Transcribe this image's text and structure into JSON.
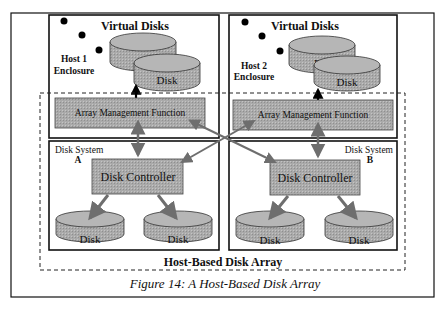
{
  "figure": {
    "caption": "Figure 14: A Host-Based Disk Array",
    "array_label": "Host-Based Disk Array"
  },
  "hosts": [
    {
      "title": "Virtual Disks",
      "enclosure_line1": "Host 1",
      "enclosure_line2": "Enclosure",
      "virtual_disk_label": "Disk",
      "amf_label": "Array Management Function"
    },
    {
      "title": "Virtual Disks",
      "enclosure_line1": "Host 2",
      "enclosure_line2": "Enclosure",
      "virtual_disk_label": "Disk",
      "amf_label": "Array Management Function"
    }
  ],
  "disk_systems": [
    {
      "label_line1": "Disk System",
      "label_line2": "A",
      "controller_label": "Disk Controller",
      "disks": [
        "Disk",
        "Disk"
      ]
    },
    {
      "label_line1": "Disk System",
      "label_line2": "B",
      "controller_label": "Disk Controller",
      "disks": [
        "Disk",
        "Disk"
      ]
    }
  ],
  "colors": {
    "box_fill": "#a9a9a9",
    "disk_fill": "#a4a4a4",
    "disk_top": "#b4b4b4",
    "arrow": "#6e6e6e",
    "line": "#111111"
  }
}
